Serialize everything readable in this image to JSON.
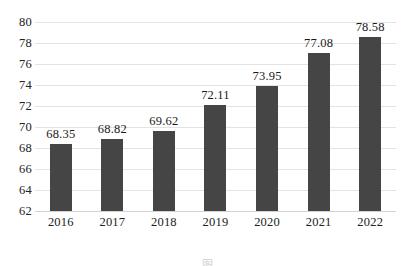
{
  "chart_data": {
    "type": "bar",
    "title": "",
    "subtitle": "",
    "xlabel": "",
    "ylabel": "",
    "categories": [
      "2016",
      "2017",
      "2018",
      "2019",
      "2020",
      "2021",
      "2022"
    ],
    "values": [
      68.35,
      68.82,
      69.62,
      72.11,
      73.95,
      77.08,
      78.58
    ],
    "data_labels": [
      "68.35",
      "68.82",
      "69.62",
      "72.11",
      "73.95",
      "77.08",
      "78.58"
    ],
    "series": [
      {
        "name": "",
        "values": [
          68.35,
          68.82,
          69.62,
          72.11,
          73.95,
          77.08,
          78.58
        ]
      }
    ],
    "ylim": [
      62,
      80
    ],
    "ytick_step": 2,
    "ytick_labels": [
      "80",
      "78",
      "76",
      "74",
      "72",
      "70",
      "68",
      "66",
      "64",
      "62"
    ],
    "ytick_values": [
      80,
      78,
      76,
      74,
      72,
      70,
      68,
      66,
      64,
      62
    ],
    "xtick_labels": [
      "2016",
      "2017",
      "2018",
      "2019",
      "2020",
      "2021",
      "2022"
    ],
    "grid": true,
    "grid_axis": "y",
    "legend": false,
    "legend_position": "none",
    "bar_color": "#454545",
    "gridline_color": "#e3e3e3",
    "background_color": "#ffffff",
    "text_color": "#1a1a1a"
  },
  "caption": {
    "text": "图"
  }
}
